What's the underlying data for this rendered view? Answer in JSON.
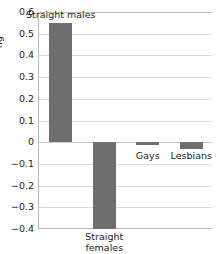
{
  "chart_data": {
    "type": "bar",
    "title": "",
    "subtitle": "",
    "xlabel": "",
    "ylabel": "",
    "categories": [
      "Straight males",
      "Straight females",
      "Gays",
      "Lesbians"
    ],
    "values": [
      0.55,
      -0.4,
      -0.015,
      -0.03
    ],
    "ylim": [
      -0.4,
      0.6
    ],
    "yticks": [
      "0.6",
      "0.5",
      "0.4",
      "0.3",
      "0.2",
      "0.1",
      "0",
      "−0.1",
      "−0.2",
      "−0.3",
      "−0.4"
    ],
    "ytick_values": [
      0.6,
      0.5,
      0.4,
      0.3,
      0.2,
      0.1,
      0,
      -0.1,
      -0.2,
      -0.3,
      -0.4
    ],
    "grid": true,
    "legend": "none",
    "bar_color": "#6e6e6e",
    "grid_color": "#dcdcdc",
    "axis_color": "#b9b9b9",
    "annotations": [
      {
        "text": "Straight males",
        "position": "above-bar"
      },
      {
        "text": "Straight females",
        "position": "below-axis"
      },
      {
        "text": "Gays",
        "position": "below-bar"
      },
      {
        "text": "Lesbians",
        "position": "below-bar"
      }
    ]
  },
  "axis": {
    "y_title_cropped": "ng"
  },
  "labels": {
    "straight_males": "Straight males",
    "straight_females_line1": "Straight",
    "straight_females_line2": "females",
    "gays": "Gays",
    "lesbians": "Lesbians"
  }
}
